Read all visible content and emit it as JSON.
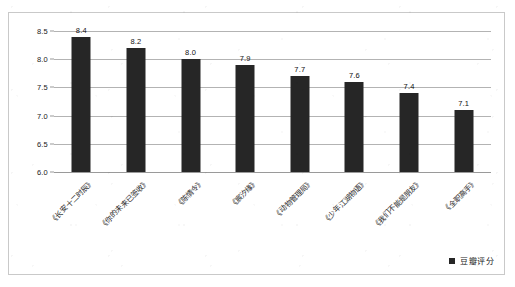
{
  "chart_data": {
    "type": "bar",
    "title": "",
    "xlabel": "",
    "ylabel": "",
    "ylim": [
      6.0,
      8.5
    ],
    "yticks": [
      "6.0",
      "6.5",
      "7.0",
      "7.5",
      "8.0",
      "8.5"
    ],
    "ytick_values": [
      6.0,
      6.5,
      7.0,
      7.5,
      8.0,
      8.5
    ],
    "grid": true,
    "legend": {
      "position": "bottom-right",
      "entries": [
        {
          "label": "豆瓣评分",
          "color": "#262626"
        }
      ]
    },
    "series": [
      {
        "name": "豆瓣评分",
        "color": "#262626",
        "values": [
          8.4,
          8.2,
          8.0,
          7.9,
          7.7,
          7.6,
          7.4,
          7.1
        ]
      }
    ],
    "categories": [
      "《长安十二时辰》",
      "《你的未来已签收》",
      "《陈情令》",
      "《宸汐缘》",
      "《动物管理局》",
      "《少年江湖物语》",
      "《我们不能是朋友》",
      "《全职高手》"
    ],
    "data_labels": [
      "8.4",
      "8.2",
      "8.0",
      "7.9",
      "7.7",
      "7.6",
      "7.4",
      "7.1"
    ]
  },
  "colors": {
    "bar": "#262626",
    "gridline": "#b3b3b3",
    "frame": "#c9c9c9",
    "background": "#ffffff",
    "text": "#1a1a1a"
  }
}
